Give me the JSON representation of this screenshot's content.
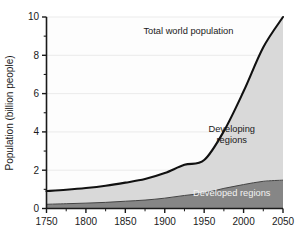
{
  "figure": {
    "background_color": "#ffffff",
    "plot_background_color": "#fdfdfd",
    "axis_color": "#1a1a1a",
    "grid_color": "#e6e6e6",
    "total_line_color": "#111111",
    "developing_fill_color": "#d9d9d9",
    "developed_fill_color": "#868686"
  },
  "chart_data": {
    "type": "area",
    "title": "",
    "subtitle": "",
    "xlabel": "",
    "ylabel": "Population (billion people)",
    "xlim": [
      1750,
      2050
    ],
    "ylim": [
      0,
      10
    ],
    "grid": true,
    "grid_axis": "y",
    "legend_position": "inline-annotations",
    "stacked": true,
    "x_ticks": [
      1750,
      1800,
      1850,
      1900,
      1950,
      2000,
      2050
    ],
    "x_tick_labels": [
      "1750",
      "1800",
      "1850",
      "1900",
      "1950",
      "2000",
      "2050"
    ],
    "x_minor_tick_interval": 25,
    "y_ticks": [
      0,
      2,
      4,
      6,
      8,
      10
    ],
    "y_tick_labels": [
      "0",
      "2",
      "4",
      "6",
      "8",
      "10"
    ],
    "y_minor_ticks": [
      1,
      3,
      5,
      7,
      9
    ],
    "x": [
      1750,
      1775,
      1800,
      1825,
      1850,
      1875,
      1900,
      1925,
      1950,
      1975,
      2000,
      2025,
      2050
    ],
    "series": [
      {
        "name": "Developed regions",
        "fill": "#868686",
        "values": [
          0.22,
          0.25,
          0.28,
          0.32,
          0.38,
          0.44,
          0.54,
          0.68,
          0.81,
          1.05,
          1.25,
          1.42,
          1.48
        ]
      },
      {
        "name": "Developing regions",
        "fill": "#d9d9d9",
        "values": [
          0.69,
          0.73,
          0.79,
          0.87,
          0.97,
          1.1,
          1.31,
          1.6,
          1.72,
          2.99,
          4.87,
          7.0,
          8.52
        ]
      }
    ],
    "total_line": {
      "name": "Total world population",
      "color": "#111111",
      "values": [
        0.91,
        0.98,
        1.07,
        1.19,
        1.35,
        1.54,
        1.85,
        2.28,
        2.53,
        4.04,
        6.12,
        8.42,
        10.0
      ]
    },
    "annotations": [
      {
        "name": "total-world-population",
        "text": "Total world population",
        "x": 1930,
        "y": 9.1,
        "color": "#1a1a1a"
      },
      {
        "name": "developing-regions",
        "text_lines": [
          "Developing",
          "regions"
        ],
        "x": 1985,
        "y": 4.0,
        "color": "#1a1a1a"
      },
      {
        "name": "developed-regions",
        "text": "Developed regions",
        "x": 1985,
        "y": 0.65,
        "color": "#f2f2f2"
      }
    ]
  }
}
